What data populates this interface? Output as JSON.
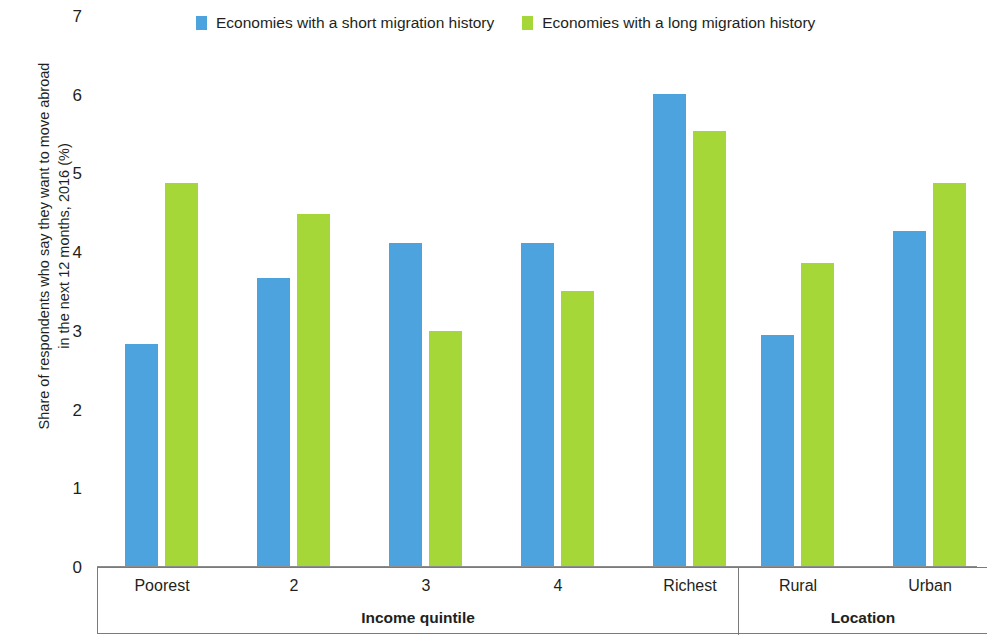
{
  "chart_data": {
    "type": "bar",
    "title": "",
    "subtitle": "",
    "xlabel": "",
    "ylabel": "Share of respondents who say they want to move abroad in the next 12 months, 2016 (%)",
    "ylabel_lines": [
      "Share of respondents who say they want to move abroad",
      "in the next 12 months, 2016 (%)"
    ],
    "ylim": [
      0,
      7
    ],
    "yticks": [
      0,
      1,
      2,
      3,
      4,
      5,
      6,
      7
    ],
    "ytick_labels": [
      "0",
      "1",
      "2",
      "3",
      "4",
      "5",
      "6",
      "7"
    ],
    "grid": false,
    "legend_position": "top",
    "categories": [
      "Poorest",
      "2",
      "3",
      "4",
      "Richest",
      "Rural",
      "Urban"
    ],
    "groups": [
      {
        "name": "Income quintile",
        "categories": [
          "Poorest",
          "2",
          "3",
          "4",
          "Richest"
        ]
      },
      {
        "name": "Location",
        "categories": [
          "Rural",
          "Urban"
        ]
      }
    ],
    "series": [
      {
        "name": "Economies with a short migration history",
        "color": "#4CA3DD",
        "values": [
          2.82,
          3.66,
          4.1,
          4.1,
          6.0,
          2.94,
          4.25
        ]
      },
      {
        "name": "Economies with a long migration history",
        "color": "#A5D738",
        "values": [
          4.86,
          4.47,
          2.98,
          3.49,
          5.53,
          3.85,
          4.86
        ]
      }
    ]
  },
  "axis": {
    "baseline_color": "#8c8c8c",
    "box_color": "#7b7b7b"
  }
}
